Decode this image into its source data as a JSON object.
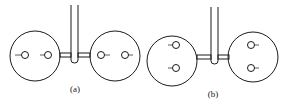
{
  "figure": {
    "panels": [
      {
        "id": "a",
        "label": "(a)",
        "description": "Two circles side by side connected by a U-shaped tube; each circle contains two holes arranged horizontally",
        "hole_arrangement": "horizontal"
      },
      {
        "id": "b",
        "label": "(b)",
        "description": "Two circles side by side connected by a U-shaped tube; each circle contains two holes arranged vertically",
        "hole_arrangement": "vertical"
      }
    ],
    "colors": {
      "stroke": "#1a1a1a",
      "background": "#ffffff"
    }
  }
}
